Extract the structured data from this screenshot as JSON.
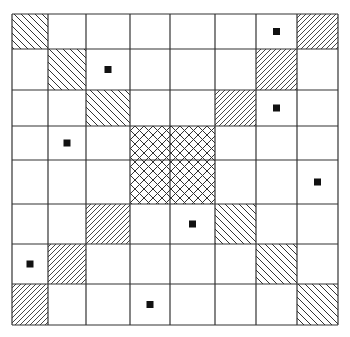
{
  "board": {
    "rows": 8,
    "cols": 8,
    "col_lines": [
      12,
      48,
      86,
      130,
      170,
      215,
      256,
      297,
      338
    ],
    "row_lines": [
      14,
      49,
      90,
      126,
      160,
      204,
      244,
      284,
      325
    ],
    "line_color": "#333333",
    "dot_color": "#111111",
    "cells": [
      {
        "row": 0,
        "col": 0,
        "type": "hatch-back"
      },
      {
        "row": 0,
        "col": 6,
        "type": "dot"
      },
      {
        "row": 0,
        "col": 7,
        "type": "hatch-fwd"
      },
      {
        "row": 1,
        "col": 1,
        "type": "hatch-back"
      },
      {
        "row": 1,
        "col": 2,
        "type": "dot"
      },
      {
        "row": 1,
        "col": 6,
        "type": "hatch-fwd"
      },
      {
        "row": 2,
        "col": 2,
        "type": "hatch-back"
      },
      {
        "row": 2,
        "col": 5,
        "type": "hatch-fwd"
      },
      {
        "row": 2,
        "col": 6,
        "type": "dot"
      },
      {
        "row": 3,
        "col": 1,
        "type": "dot"
      },
      {
        "row": 3,
        "col": 3,
        "type": "crosshatch"
      },
      {
        "row": 3,
        "col": 4,
        "type": "crosshatch"
      },
      {
        "row": 4,
        "col": 3,
        "type": "crosshatch"
      },
      {
        "row": 4,
        "col": 4,
        "type": "crosshatch"
      },
      {
        "row": 4,
        "col": 7,
        "type": "dot"
      },
      {
        "row": 5,
        "col": 2,
        "type": "hatch-fwd"
      },
      {
        "row": 5,
        "col": 4,
        "type": "dot"
      },
      {
        "row": 5,
        "col": 5,
        "type": "hatch-back"
      },
      {
        "row": 6,
        "col": 0,
        "type": "dot"
      },
      {
        "row": 6,
        "col": 1,
        "type": "hatch-fwd"
      },
      {
        "row": 6,
        "col": 6,
        "type": "hatch-back"
      },
      {
        "row": 7,
        "col": 0,
        "type": "hatch-fwd"
      },
      {
        "row": 7,
        "col": 3,
        "type": "dot"
      },
      {
        "row": 7,
        "col": 7,
        "type": "hatch-back"
      }
    ]
  }
}
